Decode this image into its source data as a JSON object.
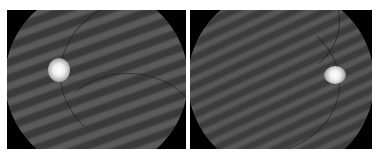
{
  "figure": {
    "background": "#ffffff",
    "panels": [
      {
        "id": "left",
        "description": "Grayscale retinal fundus image with moire stripe artifact, optic disc on left side",
        "frame": {
          "x": 7,
          "y": 10,
          "w": 179,
          "h": 139
        },
        "optic_disc": {
          "x": 61,
          "y": 72
        },
        "stripe_angle_deg": 70
      },
      {
        "id": "right",
        "description": "Grayscale retinal fundus image with moire stripe artifact, optic disc on right side",
        "frame": {
          "x": 190,
          "y": 10,
          "w": 182,
          "h": 139
        },
        "optic_disc": {
          "x": 338,
          "y": 78
        },
        "stripe_angle_deg": 65
      }
    ],
    "colors": {
      "frame_black": "#000000",
      "fundus_gray": "#4a4a4a",
      "stripe_dark": "#3a3a3a",
      "stripe_light": "#5a5a5a",
      "disc": "#ffffff"
    }
  }
}
